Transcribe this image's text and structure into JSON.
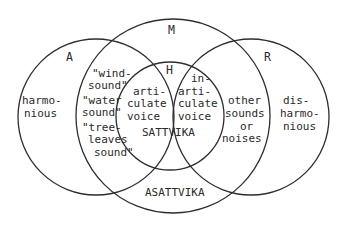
{
  "diagram": {
    "type": "venn",
    "circles": [
      {
        "id": "M",
        "label": "M"
      },
      {
        "id": "A",
        "label": "A"
      },
      {
        "id": "R",
        "label": "R"
      },
      {
        "id": "H",
        "label": "H"
      }
    ],
    "regions": {
      "a_only": [
        "harmo-",
        "nious"
      ],
      "r_only": [
        "dis-",
        "harmo-",
        "nious"
      ],
      "a_and_m": [
        "\"wind-",
        "sound\"",
        "\"water",
        "sound\"",
        "\"tree-",
        "leaves",
        "sound\""
      ],
      "r_and_m": [
        "other",
        "sounds",
        "or",
        "noises"
      ],
      "h_left": [
        "arti-",
        "culate",
        "voice"
      ],
      "h_right": [
        "in-",
        "arti-",
        "culate",
        "voice"
      ],
      "h_bottom": "SATTVIKA",
      "m_bottom": "ASATTVIKA"
    }
  }
}
